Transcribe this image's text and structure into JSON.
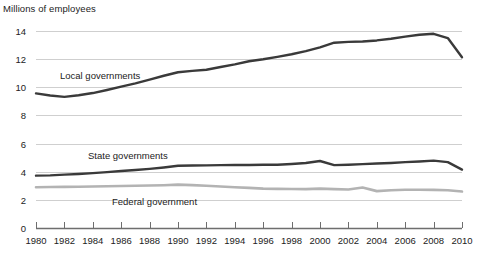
{
  "chart_data": {
    "type": "line",
    "title": "Millions of employees",
    "xlabel": "",
    "ylabel": "Millions of employees",
    "ylim": [
      0,
      14
    ],
    "xlim": [
      1980,
      2010
    ],
    "ytick_step": 2,
    "xtick_step": 2,
    "grid": true,
    "legend_position": "inline-labels",
    "yticks": [
      "0",
      "2",
      "4",
      "6",
      "8",
      "10",
      "12",
      "14"
    ],
    "xticks": [
      "1980",
      "1982",
      "1984",
      "1986",
      "1988",
      "1990",
      "1992",
      "1994",
      "1996",
      "1998",
      "2000",
      "2002",
      "2004",
      "2006",
      "2008",
      "2010"
    ],
    "x": [
      1980,
      1981,
      1982,
      1983,
      1984,
      1985,
      1986,
      1987,
      1988,
      1989,
      1990,
      1991,
      1992,
      1993,
      1994,
      1995,
      1996,
      1997,
      1998,
      1999,
      2000,
      2001,
      2002,
      2003,
      2004,
      2005,
      2006,
      2007,
      2008,
      2009,
      2010
    ],
    "series": [
      {
        "name": "Local governments",
        "color": "#3a3a3a",
        "values": [
          9.57,
          9.42,
          9.32,
          9.43,
          9.59,
          9.81,
          10.05,
          10.28,
          10.54,
          10.82,
          11.07,
          11.17,
          11.25,
          11.44,
          11.63,
          11.85,
          11.99,
          12.16,
          12.35,
          12.57,
          12.84,
          13.17,
          13.23,
          13.25,
          13.33,
          13.45,
          13.6,
          13.73,
          13.8,
          13.5,
          12.14
        ]
      },
      {
        "name": "State governments",
        "color": "#3a3a3a",
        "values": [
          3.72,
          3.74,
          3.79,
          3.84,
          3.9,
          3.97,
          4.05,
          4.12,
          4.2,
          4.3,
          4.42,
          4.44,
          4.45,
          4.47,
          4.48,
          4.48,
          4.49,
          4.5,
          4.55,
          4.62,
          4.76,
          4.47,
          4.5,
          4.54,
          4.58,
          4.62,
          4.68,
          4.73,
          4.79,
          4.68,
          4.15
        ]
      },
      {
        "name": "Federal government",
        "color": "#b3b3b3",
        "values": [
          2.9,
          2.91,
          2.92,
          2.93,
          2.95,
          2.97,
          2.98,
          3.0,
          3.02,
          3.04,
          3.08,
          3.05,
          3.0,
          2.95,
          2.9,
          2.85,
          2.8,
          2.78,
          2.77,
          2.76,
          2.8,
          2.76,
          2.74,
          2.88,
          2.62,
          2.68,
          2.72,
          2.72,
          2.71,
          2.68,
          2.59
        ]
      }
    ]
  },
  "labels": {
    "axis_title": "Millions of employees",
    "local": "Local governments",
    "state": "State governments",
    "federal": "Federal government"
  },
  "colors": {
    "dark_line": "#3a3a3a",
    "light_line": "#b3b3b3",
    "grid": "#cfcfcf",
    "axis": "#6e6e6e",
    "text": "#222222",
    "background": "#ffffff"
  }
}
